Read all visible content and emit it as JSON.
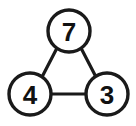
{
  "diagram": {
    "type": "node-graph",
    "background_color": "#ffffff",
    "stroke_color": "#1a1a1a",
    "label_color": "#111111",
    "nodes": [
      {
        "id": "top",
        "label": "7",
        "cx": 69,
        "cy": 31,
        "r": 21
      },
      {
        "id": "bottom-left",
        "label": "4",
        "cx": 30,
        "cy": 94,
        "r": 21
      },
      {
        "id": "bottom-right",
        "label": "3",
        "cx": 107,
        "cy": 94,
        "r": 21
      }
    ],
    "edges": [
      {
        "id": "edge-top-left",
        "from": "top",
        "to": "bottom-left",
        "x1": 57,
        "y1": 48,
        "x2": 42,
        "y2": 77
      },
      {
        "id": "edge-top-right",
        "from": "top",
        "to": "bottom-right",
        "x1": 81,
        "y1": 48,
        "x2": 96,
        "y2": 77
      },
      {
        "id": "edge-left-right",
        "from": "bottom-left",
        "to": "bottom-right",
        "x1": 51,
        "y1": 94,
        "x2": 86,
        "y2": 94
      }
    ]
  }
}
